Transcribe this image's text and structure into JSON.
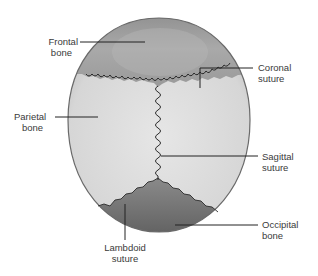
{
  "diagram": {
    "labels": {
      "frontal": {
        "line1": "Frontal",
        "line2": "bone"
      },
      "coronal": {
        "line1": "Coronal",
        "line2": "suture"
      },
      "parietal": {
        "line1": "Parietal",
        "line2": "bone"
      },
      "sagittal": {
        "line1": "Sagittal",
        "line2": "suture"
      },
      "occipital": {
        "line1": "Occipital",
        "line2": "bone"
      },
      "lambdoid": {
        "line1": "Lambdoid",
        "line2": "suture"
      }
    },
    "colors": {
      "parietal_fill": "#d9d9d9",
      "frontal_fill": "#9a9a9a",
      "occipital_fill": "#6f6f6f",
      "outline": "#555555",
      "suture": "#2a2a2a",
      "leader": "#222222"
    }
  }
}
